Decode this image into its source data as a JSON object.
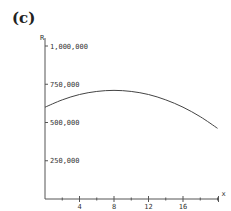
{
  "panel_label": "(c)",
  "chart_data": {
    "type": "line",
    "title": "",
    "xlabel": "x",
    "ylabel": "R",
    "xlim": [
      0,
      20
    ],
    "ylim": [
      0,
      1000000
    ],
    "x_ticks": [
      4,
      8,
      12,
      16
    ],
    "x_tick_labels": [
      "4",
      "8",
      "12",
      "16"
    ],
    "x_minor_ticks": [
      2,
      6,
      10,
      14,
      18,
      20
    ],
    "y_ticks": [
      250000,
      500000,
      750000,
      1000000
    ],
    "y_tick_labels": [
      "250,000",
      "500,000",
      "750,000",
      "1,000,000"
    ],
    "grid": false,
    "legend": null,
    "series": [
      {
        "name": "R(x)",
        "x": [
          0,
          2,
          4,
          6,
          8,
          10,
          12,
          14,
          16,
          18,
          20
        ],
        "values": [
          600000,
          648000,
          683000,
          703000,
          710000,
          703000,
          683000,
          648000,
          600000,
          538000,
          462000
        ]
      }
    ]
  },
  "colors": {
    "axis": "#555555",
    "curve": "#444444",
    "text": "#333333"
  }
}
